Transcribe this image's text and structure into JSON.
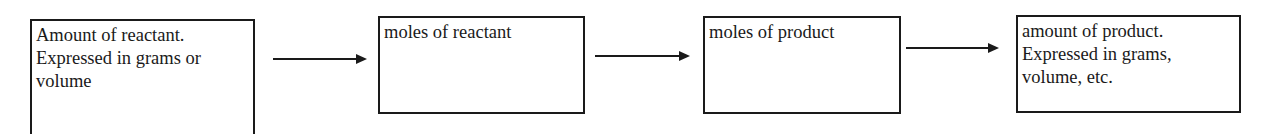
{
  "diagram": {
    "type": "flowchart",
    "direction": "left-to-right",
    "nodes": [
      {
        "id": "amount-of-reactant",
        "lines": [
          "Amount of reactant.",
          "Expressed in grams or",
          "volume"
        ]
      },
      {
        "id": "moles-of-reactant",
        "lines": [
          "moles of reactant"
        ]
      },
      {
        "id": "moles-of-product",
        "lines": [
          "moles of product"
        ]
      },
      {
        "id": "amount-of-product",
        "lines": [
          "amount of product.",
          "Expressed in grams,",
          "volume, etc."
        ]
      }
    ],
    "edges": [
      {
        "from": "amount-of-reactant",
        "to": "moles-of-reactant",
        "label": ""
      },
      {
        "from": "moles-of-reactant",
        "to": "moles-of-product",
        "label": ""
      },
      {
        "from": "moles-of-product",
        "to": "amount-of-product",
        "label": ""
      }
    ],
    "colors": {
      "stroke": "#1a1a1a",
      "background": "#ffffff",
      "text": "#1a1a1a"
    }
  }
}
